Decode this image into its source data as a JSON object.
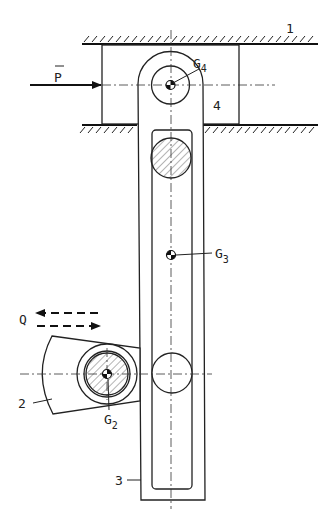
{
  "diagram": {
    "type": "mechanism schematic",
    "labels": {
      "ground": "1",
      "arm": "2",
      "link": "3",
      "slider": "4",
      "force_p": "P",
      "force_q": "Q",
      "g2_base": "G",
      "g2_sub": "2",
      "g3_base": "G",
      "g3_sub": "3",
      "g4_base": "G",
      "g4_sub": "4"
    },
    "components": [
      {
        "id": "1",
        "name": "ground guide (fixed frame)"
      },
      {
        "id": "2",
        "name": "rotating arm pivoted at G2"
      },
      {
        "id": "3",
        "name": "slotted link with center of mass G3"
      },
      {
        "id": "4",
        "name": "slider block with pin at G4"
      }
    ],
    "forces": [
      {
        "name": "P",
        "direction": "horizontal, to the right, applied on slider 4"
      },
      {
        "name": "Q",
        "direction": "horizontal, alternating (dashed arrows left/right), on arm 2"
      }
    ],
    "colors": {
      "ink": "#222222",
      "background": "#ffffff"
    }
  }
}
